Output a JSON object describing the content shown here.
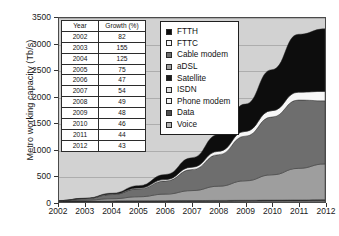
{
  "chart_data": {
    "type": "area",
    "title": "",
    "xlabel": "",
    "ylabel": "Metro working capacity (Tb/s)",
    "x": [
      2002,
      2003,
      2004,
      2005,
      2006,
      2007,
      2008,
      2009,
      2010,
      2011,
      2012
    ],
    "xtick_labels": [
      "2002",
      "2003",
      "2004",
      "2005",
      "2006",
      "2007",
      "2008",
      "2009",
      "2010",
      "2011",
      "2012"
    ],
    "ytick_labels": [
      "0",
      "500",
      "1000",
      "1500",
      "2000",
      "2500",
      "3000",
      "3500"
    ],
    "yticks": [
      0,
      500,
      1000,
      1500,
      2000,
      2500,
      3000,
      3500
    ],
    "ylim": [
      0,
      3500
    ],
    "xlim": [
      2002,
      2012
    ],
    "grid": true,
    "stacked": true,
    "legend_position": "top-right-inside",
    "plot_background": "#d2d2d2",
    "series": [
      {
        "name": "Voice",
        "color": "#b4b4b4",
        "values": [
          8,
          9,
          10,
          11,
          12,
          13,
          14,
          15,
          16,
          17,
          18
        ]
      },
      {
        "name": "Data",
        "color": "#4f4f4f",
        "values": [
          3,
          4,
          5,
          6,
          7,
          8,
          9,
          11,
          13,
          15,
          17
        ]
      },
      {
        "name": "Phone modem",
        "color": "#f2f2f2",
        "values": [
          2,
          2,
          2,
          2,
          2,
          2,
          2,
          2,
          2,
          2,
          2
        ]
      },
      {
        "name": "ISDN",
        "color": "#e0e0e0",
        "values": [
          1,
          1,
          1,
          1,
          1,
          1,
          1,
          1,
          1,
          1,
          1
        ]
      },
      {
        "name": "Satellite",
        "color": "#1c1c1c",
        "values": [
          1,
          1,
          2,
          2,
          3,
          3,
          4,
          4,
          5,
          5,
          6
        ]
      },
      {
        "name": "aDSL",
        "color": "#9e9e9e",
        "values": [
          5,
          18,
          42,
          78,
          125,
          190,
          270,
          370,
          480,
          600,
          680
        ]
      },
      {
        "name": "Cable modem",
        "color": "#6e6e6e",
        "values": [
          6,
          30,
          80,
          150,
          250,
          400,
          600,
          850,
          1100,
          1300,
          1200
        ]
      },
      {
        "name": "FTTC",
        "color": "#f7f7f7",
        "values": [
          1,
          3,
          8,
          16,
          28,
          45,
          65,
          90,
          120,
          150,
          180
        ]
      },
      {
        "name": "FTTH",
        "color": "#0d0d0d",
        "values": [
          1,
          5,
          18,
          45,
          95,
          180,
          320,
          520,
          780,
          1100,
          1190
        ]
      }
    ],
    "totals": [
      25,
      73,
      168,
      311,
      523,
      842,
      1285,
      1863,
      2517,
      3190,
      3293
    ]
  },
  "inset_table": {
    "headers": [
      "Year",
      "Growth (%)"
    ],
    "rows": [
      [
        "2002",
        "82"
      ],
      [
        "2003",
        "155"
      ],
      [
        "2004",
        "125"
      ],
      [
        "2005",
        "75"
      ],
      [
        "2006",
        "47"
      ],
      [
        "2007",
        "54"
      ],
      [
        "2008",
        "49"
      ],
      [
        "2009",
        "48"
      ],
      [
        "2010",
        "46"
      ],
      [
        "2011",
        "44"
      ],
      [
        "2012",
        "43"
      ]
    ]
  },
  "legend": {
    "items": [
      {
        "label": "FTTH",
        "color": "#0d0d0d"
      },
      {
        "label": "FTTC",
        "color": "#f7f7f7"
      },
      {
        "label": "Cable modem",
        "color": "#6e6e6e"
      },
      {
        "label": "aDSL",
        "color": "#9e9e9e"
      },
      {
        "label": "Satellite",
        "color": "#1c1c1c"
      },
      {
        "label": "ISDN",
        "color": "#e0e0e0"
      },
      {
        "label": "Phone modem",
        "color": "#f2f2f2"
      },
      {
        "label": "Data",
        "color": "#4f4f4f"
      },
      {
        "label": "Voice",
        "color": "#b4b4b4"
      }
    ]
  }
}
